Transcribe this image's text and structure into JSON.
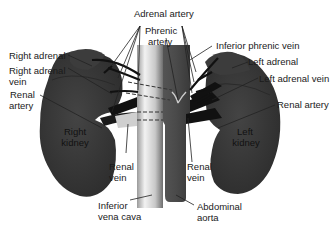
{
  "diagram": {
    "colors": {
      "organ": "#3a3a3a",
      "organ_shadow": "#2a2a2a",
      "vessel_dark": "#111111",
      "aorta": "#4a4a4a",
      "ivc_light": "#e6e6e6",
      "ivc_dark": "#8a8a8a",
      "leader_line": "#222222",
      "background": "#ffffff"
    },
    "labels": {
      "adrenal_artery": "Adrenal artery",
      "phrenic_artery_1": "Phrenic",
      "phrenic_artery_2": "artery",
      "inferior_phrenic_vein": "Inferior phrenic vein",
      "right_adrenal": "Right adrenal",
      "left_adrenal": "Left adrenal",
      "right_adrenal_vein_1": "Right adrenal",
      "right_adrenal_vein_2": "vein",
      "left_adrenal_vein": "Left adrenal vein",
      "renal_artery_left_1": "Renal",
      "renal_artery_left_2": "artery",
      "renal_artery_right": "Renal artery",
      "right_kidney_1": "Right",
      "right_kidney_2": "kidney",
      "left_kidney_1": "Left",
      "left_kidney_2": "kidney",
      "renal_vein_right_1": "Renal",
      "renal_vein_right_2": "vein",
      "renal_vein_left_1": "Renal",
      "renal_vein_left_2": "vein",
      "inferior_vena_cava_1": "Inferior",
      "inferior_vena_cava_2": "vena cava",
      "abdominal_aorta_1": "Abdominal",
      "abdominal_aorta_2": "aorta"
    }
  }
}
